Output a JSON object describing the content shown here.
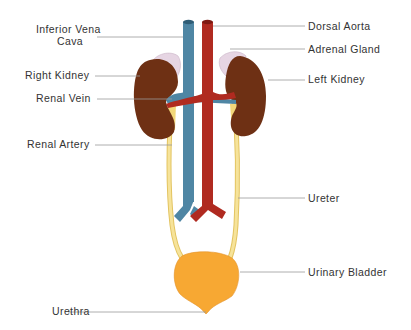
{
  "diagram": {
    "colors": {
      "vein": "#4f86a4",
      "artery": "#b02a20",
      "kidney": "#6e3014",
      "adrenal": "#e6d5e3",
      "ureter": "#f2d77a",
      "bladder": "#f7a833",
      "label": "#333333",
      "leader": "#9a9a9a"
    },
    "labels": {
      "ivc_line1": "Inferior Vena",
      "ivc_line2": "Cava",
      "right_kidney": "Right Kidney",
      "renal_vein": "Renal Vein",
      "renal_artery": "Renal Artery",
      "urethra": "Urethra",
      "dorsal_aorta": "Dorsal Aorta",
      "adrenal_gland": "Adrenal Gland",
      "left_kidney": "Left Kidney",
      "ureter": "Ureter",
      "urinary_bladder": "Urinary Bladder"
    }
  }
}
